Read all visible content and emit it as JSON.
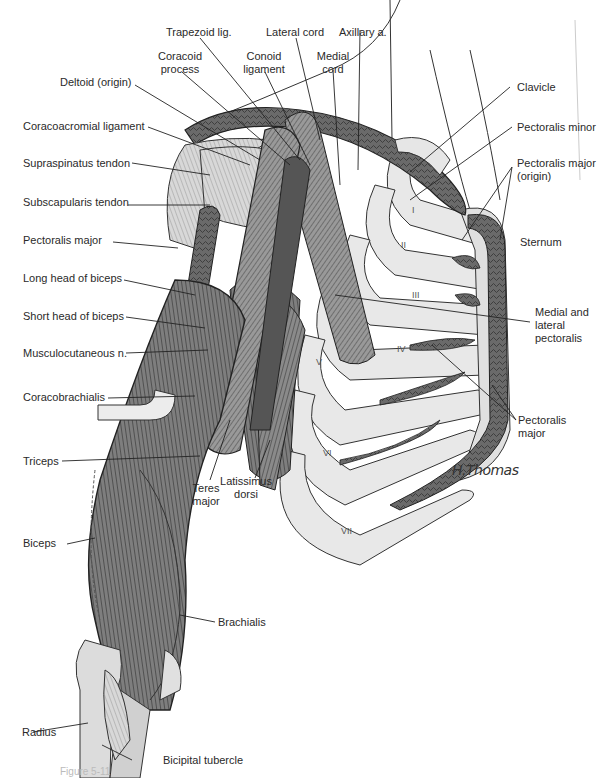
{
  "figure": {
    "signature": "H.Thomas",
    "caption": "Figure 5-11"
  },
  "labels": {
    "trapezoid_lig": "Trapezoid lig.",
    "lateral_cord": "Lateral cord",
    "axillary_a": "Axillary a.",
    "coracoid_process": [
      "Coracoid",
      "process"
    ],
    "conoid_ligament": [
      "Conoid",
      "ligament"
    ],
    "medial_cord": [
      "Medial",
      "cord"
    ],
    "deltoid_origin": "Deltoid (origin)",
    "clavicle": "Clavicle",
    "coracoacromial_ligament": "Coracoacromial ligament",
    "pectoralis_minor": "Pectoralis minor",
    "supraspinatus_tendon": "Supraspinatus tendon",
    "pectoralis_major_origin": [
      "Pectoralis major",
      "(origin)"
    ],
    "subscapularis_tendon": "Subscapularis tendon",
    "sternum": "Sternum",
    "pectoralis_major": "Pectoralis major",
    "long_head_biceps": "Long head of biceps",
    "short_head_biceps": "Short head of biceps",
    "medial_lateral_pectoralis": [
      "Medial and",
      "lateral",
      "pectoralis"
    ],
    "musculocutaneous_n": "Musculocutaneous n.",
    "coracobrachialis": "Coracobrachialis",
    "pectoralis_major_right": [
      "Pectoralis",
      "major"
    ],
    "triceps": "Triceps",
    "latissimus_dorsi": [
      "Latissimus",
      "dorsi"
    ],
    "teres_major": [
      "Teres",
      "major"
    ],
    "biceps": "Biceps",
    "brachialis": "Brachialis",
    "radius": "Radius",
    "bicipital_tubercle": "Bicipital tubercle"
  },
  "ribs": [
    "I",
    "II",
    "III",
    "IV",
    "V",
    "VI",
    "VII"
  ]
}
